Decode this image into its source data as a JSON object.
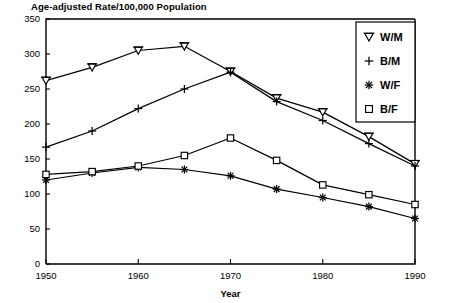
{
  "chart_data": {
    "type": "line",
    "title": "Age-adjusted Rate/100,000 Population",
    "xlabel": "Year",
    "ylabel": "",
    "xlim": [
      1950,
      1990
    ],
    "ylim": [
      0,
      350
    ],
    "grid": false,
    "legend_position": "top-right",
    "x": [
      1950,
      1955,
      1960,
      1965,
      1970,
      1975,
      1980,
      1985,
      1990
    ],
    "xticks": [
      "1950",
      "1960",
      "1970",
      "1980",
      "1990"
    ],
    "xtick_values": [
      1950,
      1960,
      1970,
      1980,
      1990
    ],
    "yticks": [
      "0",
      "50",
      "100",
      "150",
      "200",
      "250",
      "300",
      "350"
    ],
    "ytick_values": [
      0,
      50,
      100,
      150,
      200,
      250,
      300,
      350
    ],
    "series": [
      {
        "name": "W/M",
        "marker": "inverted-triangle",
        "values": [
          262,
          281,
          305,
          311,
          275,
          237,
          217,
          182,
          143
        ]
      },
      {
        "name": "B/M",
        "marker": "plus",
        "values": [
          167,
          190,
          222,
          250,
          274,
          232,
          205,
          172,
          140
        ]
      },
      {
        "name": "W/F",
        "marker": "asterisk",
        "values": [
          120,
          130,
          138,
          135,
          126,
          107,
          95,
          82,
          65
        ]
      },
      {
        "name": "B/F",
        "marker": "square",
        "values": [
          128,
          132,
          140,
          155,
          180,
          148,
          113,
          99,
          85
        ]
      }
    ]
  },
  "legend": {
    "items": [
      {
        "label": "W/M",
        "marker": "inverted-triangle"
      },
      {
        "label": "B/M",
        "marker": "plus"
      },
      {
        "label": "W/F",
        "marker": "asterisk"
      },
      {
        "label": "B/F",
        "marker": "square"
      }
    ]
  }
}
